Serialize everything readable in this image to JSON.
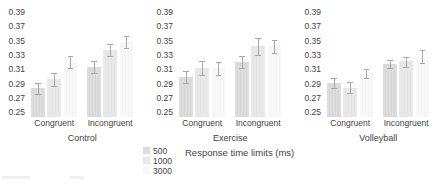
{
  "chart_data": {
    "type": "bar",
    "title": "",
    "ylabel": "",
    "xlabel": "",
    "ylim": [
      0.25,
      0.39
    ],
    "yticks": [
      0.25,
      0.27,
      0.29,
      0.31,
      0.33,
      0.35,
      0.37,
      0.39
    ],
    "grid": false,
    "legend_position": "bottom-left",
    "legend_title": "Response time limits (ms)",
    "series_names": [
      "500",
      "1000",
      "3000"
    ],
    "panels": [
      {
        "title": "Control",
        "groups": [
          {
            "label": "Congruent",
            "values": [
              0.284,
              0.297,
              0.321
            ],
            "errors_low": [
              0.276,
              0.288,
              0.313
            ],
            "errors_high": [
              0.292,
              0.306,
              0.329
            ]
          },
          {
            "label": "Incongruent",
            "values": [
              0.314,
              0.338,
              0.349
            ],
            "errors_low": [
              0.305,
              0.33,
              0.34
            ],
            "errors_high": [
              0.323,
              0.346,
              0.357
            ]
          }
        ]
      },
      {
        "title": "Exercise",
        "groups": [
          {
            "label": "Congruent",
            "values": [
              0.3,
              0.313,
              0.312
            ],
            "errors_low": [
              0.291,
              0.303,
              0.303
            ],
            "errors_high": [
              0.309,
              0.323,
              0.321
            ]
          },
          {
            "label": "Incongruent",
            "values": [
              0.321,
              0.343,
              0.343
            ],
            "errors_low": [
              0.312,
              0.331,
              0.334
            ],
            "errors_high": [
              0.329,
              0.354,
              0.352
            ]
          }
        ]
      },
      {
        "title": "Volleyball",
        "groups": [
          {
            "label": "Congruent",
            "values": [
              0.291,
              0.284,
              0.304
            ],
            "errors_low": [
              0.285,
              0.277,
              0.298
            ],
            "errors_high": [
              0.299,
              0.293,
              0.311
            ]
          },
          {
            "label": "Incongruent",
            "values": [
              0.318,
              0.322,
              0.328
            ],
            "errors_low": [
              0.312,
              0.314,
              0.319
            ],
            "errors_high": [
              0.324,
              0.328,
              0.338
            ]
          }
        ]
      }
    ],
    "colors": {
      "bar_500": "#dddddd",
      "bar_500_stripe": "#d5d5d5",
      "bar_1000": "#e9e9e9",
      "bar_1000_stripe": "#e3e3e3",
      "bar_3000": "#f8f8f8",
      "bar_3000_stripe": "#f4f4f4",
      "error_bar": "#a8a8a8",
      "text": "#3f3f3f"
    }
  }
}
